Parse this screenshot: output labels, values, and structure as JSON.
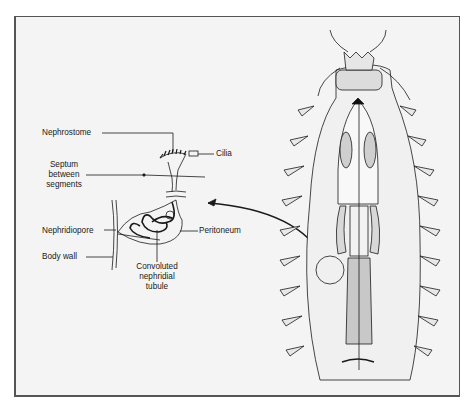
{
  "figure": {
    "type": "anatomical-diagram",
    "labels": {
      "nephrostome": "Nephrostome",
      "cilia": "Cilia",
      "septum_line1": "Septum",
      "septum_line2": "between",
      "septum_line3": "segments",
      "nephridiopore": "Nephridiopore",
      "peritoneum": "Peritoneum",
      "body_wall": "Body wall",
      "tubule_line1": "Convoluted",
      "tubule_line2": "nephridial",
      "tubule_line3": "tubule"
    },
    "colors": {
      "background": "#f4f4f4",
      "ink": "#1a1a1a",
      "frame": "#555555"
    }
  }
}
